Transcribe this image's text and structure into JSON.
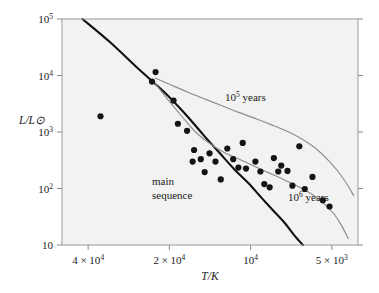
{
  "chart_data": {
    "type": "scatter",
    "title": "",
    "subtitle": "",
    "xlabel": "T/K",
    "ylabel": "L/L⊙",
    "xscale": "log",
    "yscale": "log",
    "x_reversed": true,
    "xlim": [
      50000,
      4000
    ],
    "ylim": [
      10,
      100000
    ],
    "grid": false,
    "legend": "none",
    "xticks": [
      {
        "value": 40000,
        "label_mantissa": "4 × 10",
        "label_exp": "4"
      },
      {
        "value": 20000,
        "label_mantissa": "2 × 10",
        "label_exp": "4"
      },
      {
        "value": 10000,
        "label_mantissa": "10",
        "label_exp": "4"
      },
      {
        "value": 5000,
        "label_mantissa": "5 × 10",
        "label_exp": "3"
      }
    ],
    "yticks": [
      {
        "value": 100000,
        "label_mantissa": "10",
        "label_exp": "5"
      },
      {
        "value": 10000,
        "label_mantissa": "10",
        "label_exp": "4"
      },
      {
        "value": 1000,
        "label_mantissa": "10",
        "label_exp": "3"
      },
      {
        "value": 100,
        "label_mantissa": "10",
        "label_exp": "2"
      },
      {
        "value": 10,
        "label_mantissa": "10",
        "label_exp": ""
      }
    ],
    "series": [
      {
        "name": "observed stars",
        "marker": "filled-circle",
        "marker_color": "#141414",
        "marker_size": 3.1,
        "points": [
          [
            36000,
            1900
          ],
          [
            22500,
            11500
          ],
          [
            23200,
            7800
          ],
          [
            19300,
            3600
          ],
          [
            18600,
            1400
          ],
          [
            17200,
            1050
          ],
          [
            16200,
            480
          ],
          [
            16400,
            300
          ],
          [
            15300,
            330
          ],
          [
            14800,
            195
          ],
          [
            14200,
            420
          ],
          [
            13500,
            300
          ],
          [
            12900,
            145
          ],
          [
            12200,
            510
          ],
          [
            11600,
            330
          ],
          [
            11100,
            235
          ],
          [
            10700,
            640
          ],
          [
            10400,
            225
          ],
          [
            9600,
            300
          ],
          [
            9200,
            200
          ],
          [
            8900,
            120
          ],
          [
            8500,
            105
          ],
          [
            8200,
            345
          ],
          [
            7900,
            200
          ],
          [
            7700,
            255
          ],
          [
            7300,
            205
          ],
          [
            7000,
            112
          ],
          [
            6600,
            560
          ],
          [
            6300,
            98
          ],
          [
            5900,
            160
          ],
          [
            5400,
            62
          ],
          [
            5100,
            48
          ]
        ]
      }
    ],
    "curves": [
      {
        "name": "main sequence",
        "label": "main\nsequence",
        "label_line1": "main",
        "label_line2": "sequence",
        "color": "#111111",
        "width": 2.1,
        "points": [
          [
            42000,
            100000
          ],
          [
            33000,
            38000
          ],
          [
            26000,
            13000
          ],
          [
            21000,
            5200
          ],
          [
            17500,
            2100
          ],
          [
            15000,
            900
          ],
          [
            13000,
            420
          ],
          [
            11500,
            220
          ],
          [
            10200,
            125
          ],
          [
            9200,
            72
          ],
          [
            8300,
            42
          ],
          [
            7500,
            25
          ],
          [
            6900,
            15
          ],
          [
            6400,
            10
          ]
        ]
      },
      {
        "name": "10^5 years isochrone",
        "label_mantissa": "10",
        "label_exp": "5",
        "label_suffix": "years",
        "color": "#8c8c8c",
        "width": 1.15,
        "points": [
          [
            22600,
            9000
          ],
          [
            20000,
            7000
          ],
          [
            17000,
            5000
          ],
          [
            14500,
            3700
          ],
          [
            12500,
            2800
          ],
          [
            11000,
            2200
          ],
          [
            9500,
            1700
          ],
          [
            8400,
            1350
          ],
          [
            7400,
            1050
          ],
          [
            6600,
            800
          ],
          [
            6000,
            600
          ],
          [
            5500,
            430
          ],
          [
            5100,
            300
          ],
          [
            4700,
            190
          ],
          [
            4400,
            120
          ],
          [
            4150,
            75
          ]
        ]
      },
      {
        "name": "10^6 years isochrone",
        "label_mantissa": "10",
        "label_exp": "6",
        "label_suffix": "years",
        "color": "#8c8c8c",
        "width": 1.15,
        "points": [
          [
            23000,
            8200
          ],
          [
            20500,
            4000
          ],
          [
            18000,
            1900
          ],
          [
            16000,
            1000
          ],
          [
            14000,
            600
          ],
          [
            12500,
            430
          ],
          [
            11000,
            330
          ],
          [
            9800,
            255
          ],
          [
            8800,
            200
          ],
          [
            7900,
            160
          ],
          [
            7100,
            125
          ],
          [
            6400,
            98
          ],
          [
            5800,
            74
          ],
          [
            5300,
            52
          ],
          [
            4900,
            35
          ],
          [
            4600,
            22
          ],
          [
            4350,
            13
          ]
        ]
      }
    ],
    "annotations": [
      {
        "id": "iso-1e5-label",
        "text": "10⁵ years",
        "x_data": 15500,
        "y_data": 900
      },
      {
        "id": "iso-1e6-label",
        "text": "10⁶ years",
        "x_data": 5600,
        "y_data": 68
      },
      {
        "id": "main-sequence-label",
        "text": "main sequence",
        "x_data": 15000,
        "y_data": 70
      }
    ]
  }
}
